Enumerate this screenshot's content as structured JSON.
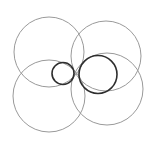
{
  "diagram": {
    "width": 152,
    "height": 145,
    "background": "#ffffff",
    "circles": [
      {
        "name": "large-circle-top-left",
        "cx": 49,
        "cy": 52,
        "r": 35,
        "stroke": "#9a9a9a",
        "stroke_width": 1
      },
      {
        "name": "large-circle-top-right",
        "cx": 106,
        "cy": 56,
        "r": 35,
        "stroke": "#9a9a9a",
        "stroke_width": 1
      },
      {
        "name": "large-circle-bottom-left",
        "cx": 49,
        "cy": 96,
        "r": 36,
        "stroke": "#9a9a9a",
        "stroke_width": 1
      },
      {
        "name": "large-circle-bottom-right",
        "cx": 107,
        "cy": 89,
        "r": 36,
        "stroke": "#9a9a9a",
        "stroke_width": 1
      },
      {
        "name": "small-dark-circle-left",
        "cx": 63,
        "cy": 73.5,
        "r": 11,
        "stroke": "#2e2e2e",
        "stroke_width": 1.6
      },
      {
        "name": "medium-dark-circle-right",
        "cx": 98,
        "cy": 74.5,
        "r": 19,
        "stroke": "#2e2e2e",
        "stroke_width": 1.6
      }
    ]
  }
}
